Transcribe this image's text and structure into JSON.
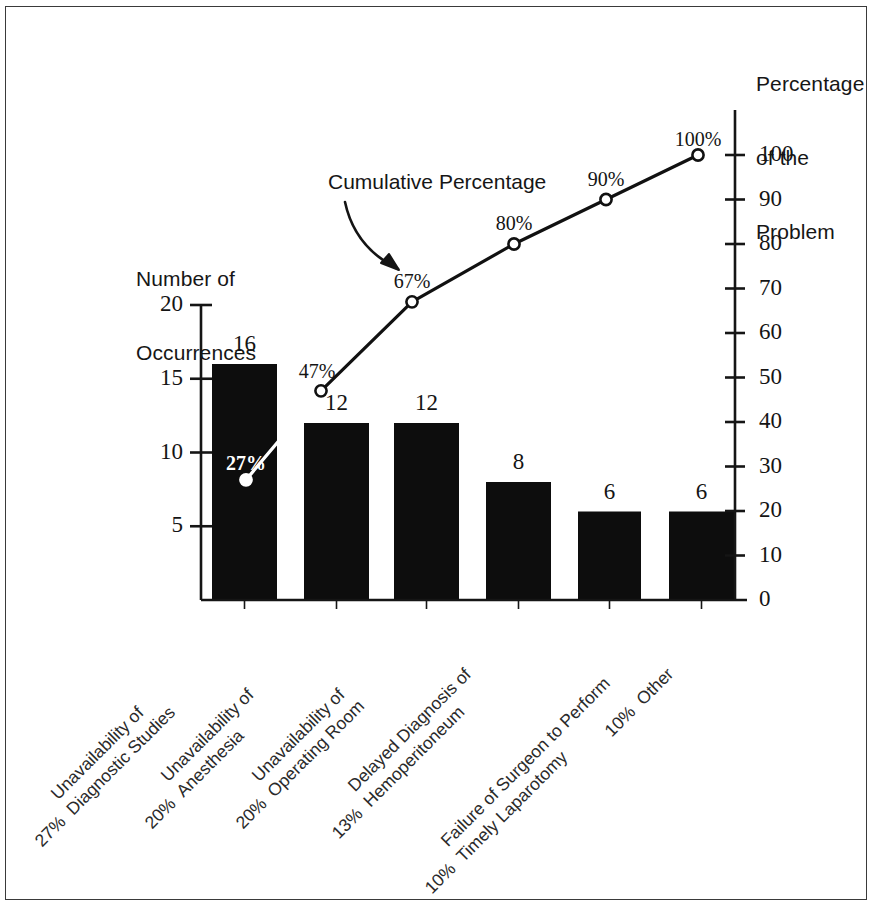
{
  "chart_data": {
    "type": "bar",
    "chart_kind": "pareto",
    "title": "",
    "categories": [
      "Unavailability of Diagnostic Studies",
      "Unavailability of Anesthesia",
      "Unavailability of Operating Room",
      "Delayed Diagnosis of Hemoperitoneum",
      "Failure of Surgeon to Perform Timely Laparotomy",
      "Other"
    ],
    "category_lines": [
      [
        "Unavailability of",
        "Diagnostic Studies"
      ],
      [
        "Unavailability of",
        "Anesthesia"
      ],
      [
        "Unavailability of",
        "Operating Room"
      ],
      [
        "Delayed Diagnosis of",
        "Hemoperitoneum"
      ],
      [
        "Failure of Surgeon to Perform",
        "Timely Laparotomy"
      ],
      [
        "Other"
      ]
    ],
    "category_percent_labels": [
      "27%",
      "20%",
      "20%",
      "13%",
      "10%",
      "10%"
    ],
    "values": [
      16,
      12,
      12,
      8,
      6,
      6
    ],
    "bar_value_labels": [
      "16",
      "12",
      "12",
      "8",
      "6",
      "6"
    ],
    "series": [
      {
        "name": "Number of Occurrences",
        "type": "bar",
        "values": [
          16,
          12,
          12,
          8,
          6,
          6
        ]
      },
      {
        "name": "Cumulative Percentage",
        "type": "line",
        "values": [
          27,
          47,
          67,
          80,
          90,
          100
        ]
      }
    ],
    "cumulative_labels": [
      "27%",
      "47%",
      "67%",
      "80%",
      "90%",
      "100%"
    ],
    "xlabel": "",
    "ylabel": "Number of Occurrences",
    "ylabel_right": "Percentage of the Problem",
    "ylim": [
      0,
      20
    ],
    "ylim_right": [
      0,
      100
    ],
    "yticks": [
      5,
      10,
      15,
      20
    ],
    "ytick_labels": [
      "5",
      "10",
      "15",
      "20"
    ],
    "yticks_right": [
      0,
      10,
      20,
      30,
      40,
      50,
      60,
      70,
      80,
      90,
      100
    ],
    "ytick_labels_right": [
      "0",
      "10",
      "20",
      "30",
      "40",
      "50",
      "60",
      "70",
      "80",
      "90",
      "100"
    ],
    "grid": false,
    "legend": "none",
    "annotations": [
      {
        "text": "Cumulative Percentage",
        "points_to": "cumulative line"
      }
    ],
    "colors": {
      "bar": "#0d0d0d",
      "line": "#111111",
      "marker_fill": "#ffffff",
      "axis": "#151515",
      "background": "#ffffff",
      "frame": "#3a3a3a",
      "inverted_label": "#ffffff"
    }
  },
  "axes": {
    "left_title_lines": [
      "Number of",
      "Occurrences"
    ],
    "right_title_lines": [
      "Percentage",
      "of the",
      "Problem"
    ]
  },
  "annotation": {
    "cumulative": "Cumulative Percentage"
  }
}
